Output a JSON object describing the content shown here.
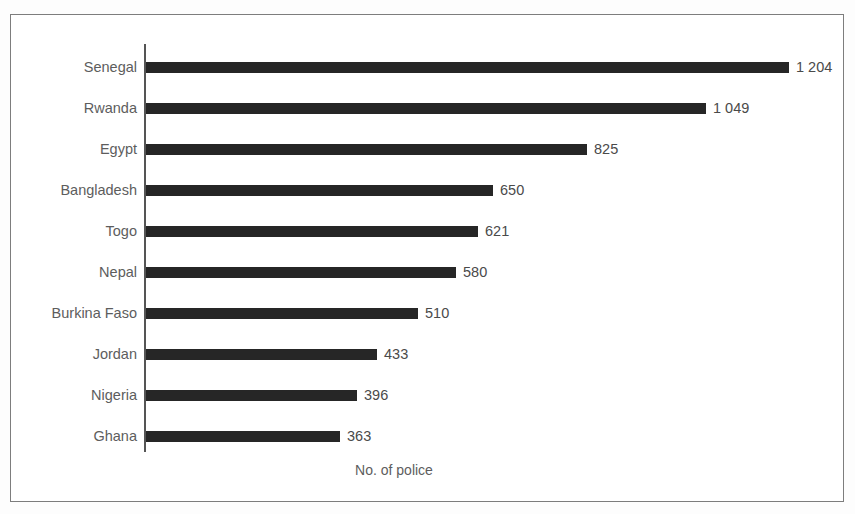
{
  "chart_data": {
    "type": "bar",
    "orientation": "horizontal",
    "title": "",
    "subtitle": "",
    "xlabel": "No. of police",
    "ylabel": "",
    "categories": [
      "Senegal",
      "Rwanda",
      "Egypt",
      "Bangladesh",
      "Togo",
      "Nepal",
      "Burkina Faso",
      "Jordan",
      "Nigeria",
      "Ghana"
    ],
    "values": [
      1204,
      1049,
      825,
      650,
      621,
      580,
      510,
      433,
      396,
      363
    ],
    "value_labels": [
      "1 204",
      "1 049",
      "825",
      "650",
      "621",
      "580",
      "510",
      "433",
      "396",
      "363"
    ],
    "xlim": [
      0,
      1204
    ],
    "grid": false,
    "legend": null,
    "bar_color": "#262626",
    "axis_color": "#555555",
    "text_color": "#5d5d5d",
    "frame_color": "#7d7d7d",
    "background": "#ffffff"
  }
}
